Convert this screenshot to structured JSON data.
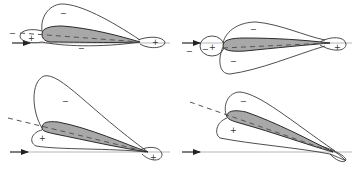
{
  "figure": {
    "colors": {
      "airfoil_fill": "#a8a8a8",
      "outline": "#3a3a3a",
      "background": "#ffffff"
    },
    "panels": [
      {
        "id": "top-left",
        "labels": {
          "upper": "−",
          "lower": "−",
          "leading_edge_outer": "−",
          "leading_edge_inner": "+",
          "trailing_edge": "+"
        }
      },
      {
        "id": "top-right",
        "labels": {
          "upper": "−",
          "lower": "−",
          "leading_edge_outer": "−",
          "leading_edge_mid": "−",
          "leading_edge_inner": "+",
          "trailing_edge": "+"
        }
      },
      {
        "id": "bottom-left",
        "labels": {
          "upper": "−",
          "lower": "+",
          "trailing_edge": "+"
        }
      },
      {
        "id": "bottom-right",
        "labels": {
          "upper": "−",
          "lower": "+"
        }
      }
    ]
  }
}
